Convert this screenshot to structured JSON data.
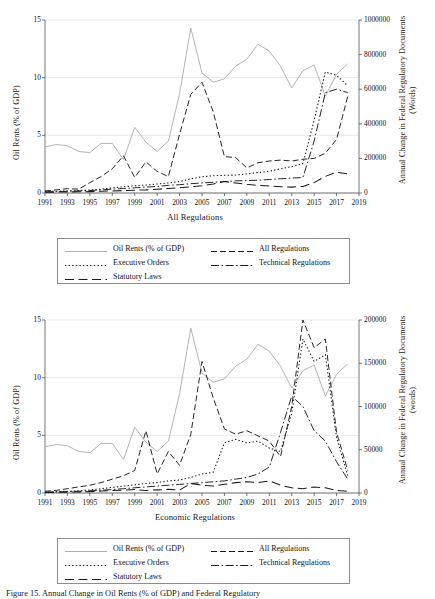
{
  "figure": {
    "caption": "Figure 15. Annual Change in Oil Rents (% of GDP) and Federal Regulatory"
  },
  "legend": {
    "entries": [
      {
        "label": "Oil Rents (% of GDP)",
        "style": "solid",
        "color": "#a6a6a6"
      },
      {
        "label": "All Regulations",
        "style": "dashed",
        "color": "#1a1a1a"
      },
      {
        "label": "Executive Orders",
        "style": "dotted",
        "color": "#1a1a1a"
      },
      {
        "label": "Technical Regulations",
        "style": "dashdot",
        "color": "#1a1a1a"
      },
      {
        "label": "Statutory Laws",
        "style": "longdash",
        "color": "#1a1a1a"
      }
    ]
  },
  "chart_data": [
    {
      "id": "all-regulations",
      "type": "line",
      "title": "",
      "xlabel": "All Regulations",
      "ylabel": "Oil Rents (% of GDP)",
      "y2label": "Annual Change in Federal Regulatory Documents (Words)",
      "xlim": [
        1991,
        2019
      ],
      "ylim": [
        0,
        15
      ],
      "y2lim": [
        0,
        1000000
      ],
      "yticks": [
        0,
        5,
        10,
        15
      ],
      "y2ticks": [
        0,
        200000,
        400000,
        600000,
        800000,
        1000000
      ],
      "xticks": [
        1991,
        1993,
        1995,
        1997,
        1999,
        2001,
        2003,
        2005,
        2007,
        2009,
        2011,
        2013,
        2015,
        2017,
        2019
      ],
      "grid": true,
      "legend_position": "below",
      "x": [
        1991,
        1992,
        1993,
        1994,
        1995,
        1996,
        1997,
        1998,
        1999,
        2000,
        2001,
        2002,
        2003,
        2004,
        2005,
        2006,
        2007,
        2008,
        2009,
        2010,
        2011,
        2012,
        2013,
        2014,
        2015,
        2016,
        2017,
        2018
      ],
      "series": [
        {
          "name": "Oil Rents (% of GDP)",
          "axis": "left",
          "style": "solid",
          "values": [
            4.0,
            4.2,
            4.1,
            3.6,
            3.5,
            4.3,
            4.3,
            2.9,
            5.7,
            4.4,
            3.6,
            4.5,
            8.6,
            14.3,
            10.4,
            9.6,
            9.9,
            11.0,
            11.6,
            12.9,
            12.3,
            11.0,
            9.1,
            10.6,
            11.1,
            8.4,
            10.3,
            11.2
          ]
        },
        {
          "name": "All Regulations",
          "axis": "right",
          "style": "dashed",
          "values": [
            12000,
            18000,
            25000,
            22000,
            60000,
            95000,
            140000,
            215000,
            90000,
            180000,
            125000,
            95000,
            340000,
            570000,
            640000,
            470000,
            210000,
            205000,
            145000,
            175000,
            185000,
            190000,
            185000,
            195000,
            200000,
            230000,
            310000,
            560000
          ]
        },
        {
          "name": "Executive Orders",
          "axis": "right",
          "style": "dotted",
          "values": [
            8000,
            10000,
            12000,
            14000,
            18000,
            22000,
            30000,
            36000,
            42000,
            46000,
            52000,
            58000,
            66000,
            82000,
            94000,
            100000,
            102000,
            104000,
            110000,
            118000,
            126000,
            140000,
            152000,
            170000,
            420000,
            700000,
            680000,
            620000
          ]
        },
        {
          "name": "Technical Regulations",
          "axis": "right",
          "style": "dashdot",
          "values": [
            6000,
            8000,
            10000,
            12000,
            14000,
            18000,
            22000,
            26000,
            30000,
            34000,
            38000,
            44000,
            48000,
            54000,
            58000,
            62000,
            66000,
            70000,
            72000,
            74000,
            78000,
            82000,
            86000,
            90000,
            300000,
            580000,
            600000,
            580000
          ]
        },
        {
          "name": "Statutory Laws",
          "axis": "right",
          "style": "longdash",
          "values": [
            4000,
            5000,
            6000,
            7000,
            8000,
            10000,
            12000,
            14000,
            16000,
            18000,
            22000,
            26000,
            30000,
            36000,
            42000,
            52000,
            66000,
            58000,
            50000,
            44000,
            40000,
            36000,
            34000,
            38000,
            60000,
            96000,
            120000,
            110000
          ]
        }
      ]
    },
    {
      "id": "economic-regulations",
      "type": "line",
      "title": "",
      "xlabel": "Economic Regulations",
      "ylabel": "Oil Rents (% of GDP)",
      "y2label": "Annual Change in Federal Regulatory Documents (words)",
      "xlim": [
        1991,
        2019
      ],
      "ylim": [
        0,
        15
      ],
      "y2lim": [
        0,
        200000
      ],
      "yticks": [
        0,
        5,
        10,
        15
      ],
      "y2ticks": [
        0,
        50000,
        100000,
        150000,
        200000
      ],
      "xticks": [
        1991,
        1993,
        1995,
        1997,
        1999,
        2001,
        2003,
        2005,
        2007,
        2009,
        2011,
        2013,
        2015,
        2017,
        2019
      ],
      "grid": true,
      "legend_position": "below",
      "x": [
        1991,
        1992,
        1993,
        1994,
        1995,
        1996,
        1997,
        1998,
        1999,
        2000,
        2001,
        2002,
        2003,
        2004,
        2005,
        2006,
        2007,
        2008,
        2009,
        2010,
        2011,
        2012,
        2013,
        2014,
        2015,
        2016,
        2017,
        2018
      ],
      "series": [
        {
          "name": "Oil Rents (% of GDP)",
          "axis": "left",
          "style": "solid",
          "values": [
            4.0,
            4.2,
            4.1,
            3.6,
            3.5,
            4.3,
            4.3,
            2.9,
            5.7,
            4.4,
            3.6,
            4.5,
            8.6,
            14.3,
            10.4,
            9.6,
            9.9,
            11.0,
            11.6,
            12.9,
            12.3,
            11.0,
            9.1,
            10.6,
            11.1,
            8.4,
            10.3,
            11.2
          ]
        },
        {
          "name": "All Regulations",
          "axis": "right",
          "style": "dashed",
          "values": [
            2000,
            3000,
            5000,
            7000,
            9000,
            12000,
            16000,
            20000,
            26000,
            72000,
            22000,
            48000,
            32000,
            68000,
            152000,
            110000,
            74000,
            68000,
            72000,
            66000,
            60000,
            42000,
            100000,
            200000,
            168000,
            178000,
            70000,
            26000
          ]
        },
        {
          "name": "Executive Orders",
          "axis": "right",
          "style": "dotted",
          "values": [
            1000,
            1500,
            2000,
            2500,
            3500,
            5000,
            6500,
            8000,
            9500,
            11000,
            12000,
            14000,
            15000,
            18000,
            22000,
            24000,
            58000,
            62000,
            58000,
            60000,
            52000,
            48000,
            92000,
            178000,
            152000,
            160000,
            64000,
            20000
          ]
        },
        {
          "name": "Technical Regulations",
          "axis": "right",
          "style": "dashdot",
          "values": [
            800,
            1200,
            1600,
            2000,
            2600,
            3200,
            4000,
            5000,
            6000,
            7000,
            8000,
            9000,
            10000,
            11000,
            12000,
            13000,
            14000,
            16000,
            18000,
            22000,
            30000,
            70000,
            112000,
            100000,
            72000,
            60000,
            36000,
            16000
          ]
        },
        {
          "name": "Statutory Laws",
          "axis": "right",
          "style": "longdash",
          "values": [
            500,
            800,
            1000,
            1200,
            1600,
            2200,
            2800,
            3400,
            4000,
            3000,
            3600,
            4200,
            3400,
            11000,
            9000,
            8000,
            10000,
            12000,
            13000,
            12000,
            14000,
            9000,
            6000,
            5000,
            7000,
            6000,
            3000,
            2000
          ]
        }
      ]
    }
  ]
}
